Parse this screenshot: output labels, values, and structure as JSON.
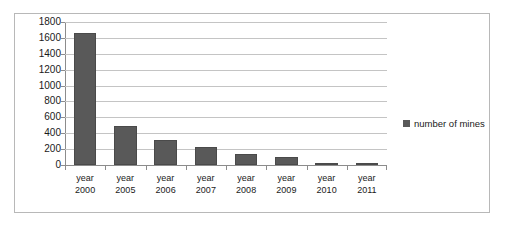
{
  "chart_data": {
    "type": "bar",
    "title": "",
    "xlabel": "",
    "ylabel": "",
    "categories": [
      "year 2000",
      "year 2005",
      "year 2006",
      "year 2007",
      "year 2008",
      "year 2009",
      "year 2010",
      "year 2011"
    ],
    "category_lines": [
      [
        "year",
        "2000"
      ],
      [
        "year",
        "2005"
      ],
      [
        "year",
        "2006"
      ],
      [
        "year",
        "2007"
      ],
      [
        "year",
        "2008"
      ],
      [
        "year",
        "2009"
      ],
      [
        "year",
        "2010"
      ],
      [
        "year",
        "2011"
      ]
    ],
    "series": [
      {
        "name": "number of mines",
        "color": "#595959",
        "values": [
          1660,
          490,
          320,
          230,
          140,
          100,
          25,
          25
        ]
      }
    ],
    "ylim": [
      0,
      1800
    ],
    "ytick_step": 200,
    "yticks": [
      1800,
      1600,
      1400,
      1200,
      1000,
      800,
      600,
      400,
      200,
      0
    ],
    "ytick_labels": [
      "1800",
      "1600",
      "1400",
      "1200",
      "1000",
      "800",
      "600",
      "400",
      "200",
      "0"
    ],
    "grid": true,
    "grid_axis": "y",
    "legend": {
      "position": "right",
      "entries": [
        {
          "label": "number of mines",
          "color": "#595959",
          "marker": "square"
        }
      ]
    },
    "frame": {
      "border_color": "#b8b8b8",
      "background": "#ffffff"
    },
    "axis_color": "#8c8c8c",
    "gridline_color": "#c4c4c4"
  }
}
